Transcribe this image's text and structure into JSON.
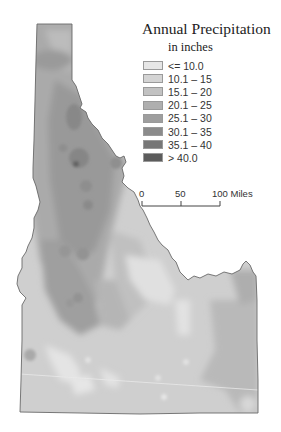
{
  "map": {
    "region": "Idaho",
    "title": "Annual Precipitation",
    "subtitle": "in inches",
    "outline_color": "#6a6a6a",
    "base_fill": "#cfcfcf"
  },
  "legend": {
    "items": [
      {
        "label": "<= 10.0",
        "color": "#e6e6e6"
      },
      {
        "label": "10.1 – 15",
        "color": "#d4d4d4"
      },
      {
        "label": "15.1 – 20",
        "color": "#c2c2c2"
      },
      {
        "label": "20.1 – 25",
        "color": "#afafaf"
      },
      {
        "label": "25.1 – 30",
        "color": "#9e9e9e"
      },
      {
        "label": "30.1 – 35",
        "color": "#8b8b8b"
      },
      {
        "label": "35.1 – 40",
        "color": "#777777"
      },
      {
        "label": "> 40.0",
        "color": "#5c5c5c"
      }
    ]
  },
  "scale_bar": {
    "ticks": [
      "0",
      "50",
      "100"
    ],
    "unit": "Miles",
    "last_label": "100 Miles"
  }
}
